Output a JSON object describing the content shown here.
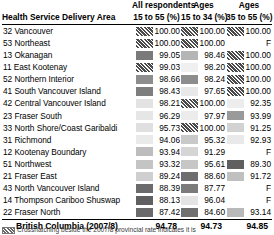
{
  "table": {
    "header": {
      "area_label": "Health Service Delivery Area",
      "columns": [
        {
          "top": "All respondents",
          "bottom": "15 to 55 (%)"
        },
        {
          "top": "Ages",
          "bottom": "15 to 34 (%)"
        },
        {
          "top": "Ages",
          "bottom": "35 to 55 (%)"
        }
      ]
    },
    "rows": [
      {
        "area": "32 Vancouver",
        "c1": "100.00",
        "c2": "100.00",
        "c3": "100.00",
        "s1": "hatch",
        "s2": "hatch",
        "s3": "hatch"
      },
      {
        "area": "53 Northeast",
        "c1": "100.00",
        "c2": "100.00",
        "c3": "F",
        "s1": "hatch",
        "s2": "hatch",
        "s3": "none"
      },
      {
        "area": "13 Okanagan",
        "c1": "99.05",
        "c2": "98.46",
        "c3": "100.00",
        "s1": "#7a7a7a",
        "s2": "#b5b5b5",
        "s3": "hatch"
      },
      {
        "area": "11 East Kootenay",
        "c1": "99.03",
        "c2": "98.20",
        "c3": "100.00",
        "s1": "hatch",
        "s2": "#f0f0f0",
        "s3": "hatch"
      },
      {
        "area": "52 Northern Interior",
        "c1": "98.66",
        "c2": "98.24",
        "c3": "100.00",
        "s1": "#8d8d8d",
        "s2": "#8d8d8d",
        "s3": "hatch"
      },
      {
        "area": "41 South Vancouver Island",
        "c1": "98.43",
        "c2": "97.65",
        "c3": "100.00",
        "s1": "#7e7e7e",
        "s2": "#e8e8e8",
        "s3": "hatch"
      },
      {
        "area": "42 Central Vancouver Island",
        "c1": "98.21",
        "c2": "100.00",
        "c3": "92.35",
        "s1": "#e3e3e3",
        "s2": "hatch",
        "s3": "#ededed"
      },
      {
        "area": "23 Fraser South",
        "c1": "96.29",
        "c2": "97.97",
        "c3": "93.99",
        "s1": "#e6e6e6",
        "s2": "#ececec",
        "s3": "#9a9a9a"
      },
      {
        "area": "33 North Shore/Coast Garibaldi",
        "c1": "95.73",
        "c2": "100.00",
        "c3": "91.25",
        "s1": "#e0e0e0",
        "s2": "hatch",
        "s3": "#d2d2d2"
      },
      {
        "area": "31 Richmond",
        "c1": "94.06",
        "c2": "95.32",
        "c3": "92.93",
        "s1": "#eaeaea",
        "s2": "#c9c9c9",
        "s3": "#e9e9e9"
      },
      {
        "area": "12 Kootenay Boundary",
        "c1": "93.94",
        "c2": "91.29",
        "c3": "F",
        "s1": "#bdbdbd",
        "s2": "#d5d5d5",
        "s3": "none"
      },
      {
        "area": "51 Northwest",
        "c1": "93.32",
        "c2": "95.61",
        "c3": "89.30",
        "s1": "#c4c4c4",
        "s2": "#c6c6c6",
        "s3": "#5f5f5f"
      },
      {
        "area": "21 Fraser East",
        "c1": "89.24",
        "c2": "88.60",
        "c3": "91.72",
        "s1": "#cfcfcf",
        "s2": "#6e6e6e",
        "s3": "#c0c0c0"
      },
      {
        "area": "43 North Vancouver Island",
        "c1": "88.39",
        "c2": "87.77",
        "c3": "F",
        "s1": "#6b6b6b",
        "s2": "#7b7b7b",
        "s3": "none"
      },
      {
        "area": "14 Thompson Cariboo Shuswap",
        "c1": "88.13",
        "c2": "96.04",
        "c3": "F",
        "s1": "#606060",
        "s2": "#e4e4e4",
        "s3": "none"
      },
      {
        "area": "22 Fraser North",
        "c1": "87.42",
        "c2": "84.60",
        "c3": "93.14",
        "s1": "#6a6a6a",
        "s2": "#707070",
        "s3": "#b9b9b9"
      }
    ],
    "summary": [
      {
        "area": "British Columbia (2007/8)",
        "c1": "94.78",
        "c2": "94.73",
        "c3": "94.85"
      },
      {
        "area": "British Columbia (2005)",
        "c1": "92.96",
        "c2": "92.51",
        "c3": "93.68"
      }
    ],
    "footnote": "Crosshatching beside the 2007/8 provincial rate indicates it is"
  }
}
